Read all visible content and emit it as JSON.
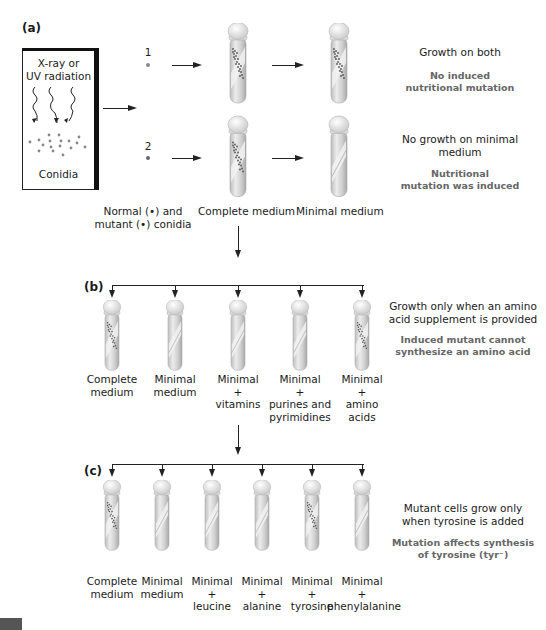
{
  "panels": {
    "a": {
      "label": "(a)",
      "radiation_box": {
        "line1": "X-ray or",
        "line2": "UV radiation",
        "bottom": "Conidia"
      },
      "samples": [
        {
          "id": "1"
        },
        {
          "id": "2"
        }
      ],
      "legend": {
        "line1": "Normal (•) and",
        "line2": "mutant (•) conidia"
      },
      "columns": [
        {
          "label": "Complete medium"
        },
        {
          "label": "Minimal medium"
        }
      ],
      "results": [
        {
          "outcome": "Growth on both",
          "conclusion_l1": "No induced",
          "conclusion_l2": "nutritional mutation",
          "growth": [
            true,
            true
          ]
        },
        {
          "outcome_l1": "No growth on minimal",
          "outcome_l2": "medium",
          "conclusion_l1": "Nutritional",
          "conclusion_l2": "mutation was induced",
          "growth": [
            true,
            false
          ]
        }
      ]
    },
    "b": {
      "label": "(b)",
      "tubes": [
        {
          "l1": "Complete",
          "l2": "medium",
          "l3": "",
          "l4": "",
          "growth": true
        },
        {
          "l1": "Minimal",
          "l2": "medium",
          "l3": "",
          "l4": "",
          "growth": false
        },
        {
          "l1": "Minimal",
          "l2": "+",
          "l3": "vitamins",
          "l4": "",
          "growth": false
        },
        {
          "l1": "Minimal",
          "l2": "+",
          "l3": "purines and",
          "l4": "pyrimidines",
          "growth": false
        },
        {
          "l1": "Minimal",
          "l2": "+",
          "l3": "amino",
          "l4": "acids",
          "growth": true
        }
      ],
      "outcome_l1": "Growth only when an amino",
      "outcome_l2": "acid supplement is provided",
      "conclusion_l1": "Induced mutant cannot",
      "conclusion_l2": "synthesize an amino acid"
    },
    "c": {
      "label": "(c)",
      "tubes": [
        {
          "l1": "Complete",
          "l2": "medium",
          "l3": "",
          "growth": true
        },
        {
          "l1": "Minimal",
          "l2": "medium",
          "l3": "",
          "growth": false
        },
        {
          "l1": "Minimal",
          "l2": "+",
          "l3": "leucine",
          "growth": false
        },
        {
          "l1": "Minimal",
          "l2": "+",
          "l3": "alanine",
          "growth": false
        },
        {
          "l1": "Minimal",
          "l2": "+",
          "l3": "tyrosine",
          "growth": true
        },
        {
          "l1": "Minimal",
          "l2": "+",
          "l3": "phenylalanine",
          "growth": false
        }
      ],
      "outcome_l1": "Mutant cells grow only",
      "outcome_l2": "when tyrosine is added",
      "conclusion_l1": "Mutation affects synthesis",
      "conclusion_l2": "of tyrosine (tyr⁻)"
    }
  },
  "colors": {
    "line": "#222222",
    "note_bold": "#666666",
    "tube_glass": "#d9d9d9",
    "cap": "#eeeeee"
  }
}
